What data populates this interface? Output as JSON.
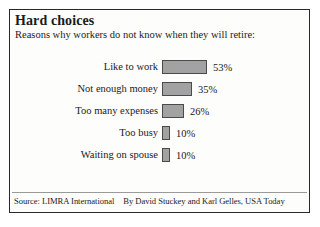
{
  "title": "Hard choices",
  "subtitle": "Reasons why workers do not know when they will retire:",
  "source": {
    "credit": "Source: LIMRA International",
    "byline": "By David Stuckey and Karl Gelles, USA Today"
  },
  "colors": {
    "bar_fill": "#a2a2a2",
    "bar_outline": "#4a4a4a",
    "border": "#2a2a2a",
    "background": "#fdfdfc",
    "text": "#1a1a1a"
  },
  "chart_data": {
    "type": "bar",
    "orientation": "horizontal",
    "title": "Hard choices",
    "subtitle": "Reasons why workers do not know when they will retire:",
    "xlabel": "",
    "ylabel": "",
    "xlim": [
      0,
      53
    ],
    "grid": false,
    "legend": null,
    "value_suffix": "%",
    "categories": [
      "Like to work",
      "Not enough money",
      "Too many expenses",
      "Too busy",
      "Waiting on spouse"
    ],
    "values": [
      53,
      35,
      26,
      10,
      10
    ],
    "value_labels": [
      "53%",
      "35%",
      "26%",
      "10%",
      "10%"
    ],
    "bars": [
      {
        "label": "Like to work",
        "value": 53,
        "value_label": "53%"
      },
      {
        "label": "Not enough money",
        "value": 35,
        "value_label": "35%"
      },
      {
        "label": "Too many expenses",
        "value": 26,
        "value_label": "26%"
      },
      {
        "label": "Too busy",
        "value": 10,
        "value_label": "10%"
      },
      {
        "label": "Waiting on spouse",
        "value": 10,
        "value_label": "10%"
      }
    ]
  }
}
